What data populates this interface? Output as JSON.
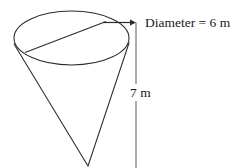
{
  "figure": {
    "kind": "geometry-diagram",
    "shape": "cone",
    "orientation": "apex-down",
    "background_color": "#ffffff",
    "stroke_color": "#2b2b2b",
    "labels": {
      "diameter": "Diameter = 6 m",
      "height": "7 m"
    },
    "measurements": {
      "diameter_value": "6",
      "diameter_unit": "m",
      "height_value": "7",
      "height_unit": "m"
    },
    "annotations": {
      "diameter_arrow": "arrow-right",
      "height_line": "vertical-dimension-line"
    }
  }
}
